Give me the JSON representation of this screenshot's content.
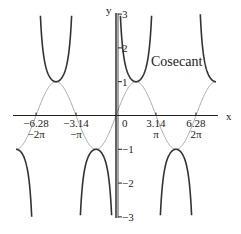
{
  "chart_data": {
    "type": "line",
    "title": "",
    "xlabel": "x",
    "ylabel": "y",
    "xlim": [
      -7.85,
      7.85
    ],
    "ylim": [
      -3,
      3
    ],
    "grid": false,
    "legend": null,
    "annotations": [
      {
        "text": "Cosecant",
        "x": 3.0,
        "y": 1.45
      }
    ],
    "x_ticks": [
      {
        "value": -6.28,
        "label": "−6.28",
        "sublabel": "−2π"
      },
      {
        "value": -3.14,
        "label": "−3.14",
        "sublabel": "−π"
      },
      {
        "value": 0,
        "label": "0",
        "sublabel": ""
      },
      {
        "value": 3.14,
        "label": "3.14",
        "sublabel": "π"
      },
      {
        "value": 6.28,
        "label": "6.28",
        "sublabel": "2π"
      }
    ],
    "y_ticks": [
      {
        "value": 3,
        "label": "3"
      },
      {
        "value": 2,
        "label": "2"
      },
      {
        "value": 1,
        "label": "1"
      },
      {
        "value": -1,
        "label": "−1"
      },
      {
        "value": -2,
        "label": "−2"
      },
      {
        "value": -3,
        "label": "−3"
      }
    ],
    "series": [
      {
        "name": "Cosecant",
        "function": "csc(x)",
        "color": "#333333",
        "width": 1.6,
        "domain": [
          -7.854,
          7.854
        ]
      },
      {
        "name": "Sine",
        "function": "sin(x)",
        "color": "#a8a8a8",
        "width": 1.0,
        "domain": [
          -7.854,
          7.854
        ]
      }
    ]
  },
  "layout": {
    "origin_px": [
      116,
      115.5
    ],
    "x_px_per_unit": 12.73,
    "y_px_per_unit": 33.8
  }
}
